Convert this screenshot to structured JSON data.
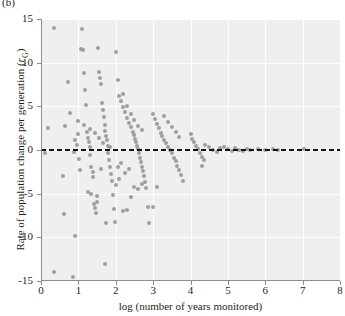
{
  "panel": {
    "tag": "(b)"
  },
  "chart_data": {
    "type": "scatter",
    "title": "",
    "xlabel": "log (number of years monitored)",
    "ylabel_plain": "Rate of population change per generation (rG)",
    "ylabel_main": "Rate of population change per generation (",
    "ylabel_italic": "r",
    "ylabel_sub": "G",
    "ylabel_close": ")",
    "xlim": [
      0,
      8
    ],
    "ylim": [
      -15,
      15
    ],
    "xticks": [
      0,
      1,
      2,
      3,
      4,
      5,
      6,
      7,
      8
    ],
    "yticks": [
      15,
      10,
      5,
      0,
      -5,
      -10,
      -15
    ],
    "grid": true,
    "grid_color": "#ffffff",
    "plot_background": "#efefef",
    "point_color": "#9a9a9a",
    "point_size_px": 4,
    "legend": "none",
    "annotations": [
      {
        "type": "hline",
        "y": 0,
        "style": "dashed",
        "color": "#111111"
      }
    ],
    "series_name": "populations",
    "n_points": 452,
    "points": [
      [
        0.12,
        -0.4
      ],
      [
        0.18,
        2.5
      ],
      [
        0.35,
        14.0
      ],
      [
        0.35,
        -14.0
      ],
      [
        0.6,
        -3.0
      ],
      [
        0.62,
        -7.3
      ],
      [
        0.65,
        2.8
      ],
      [
        0.72,
        7.8
      ],
      [
        0.78,
        4.2
      ],
      [
        0.85,
        -14.5
      ],
      [
        0.88,
        -0.2
      ],
      [
        0.9,
        -9.9
      ],
      [
        0.92,
        1.2
      ],
      [
        0.95,
        0.6
      ],
      [
        0.98,
        3.3
      ],
      [
        1.0,
        1.8
      ],
      [
        1.02,
        -1.0
      ],
      [
        1.05,
        -2.3
      ],
      [
        1.08,
        11.6
      ],
      [
        1.1,
        13.8
      ],
      [
        1.12,
        11.5
      ],
      [
        1.15,
        8.8
      ],
      [
        1.18,
        6.9
      ],
      [
        1.2,
        5.2
      ],
      [
        1.22,
        2.1
      ],
      [
        1.25,
        1.4
      ],
      [
        1.28,
        0.9
      ],
      [
        1.3,
        0.3
      ],
      [
        1.32,
        -0.6
      ],
      [
        1.35,
        -1.9
      ],
      [
        1.38,
        -2.5
      ],
      [
        1.4,
        -3.1
      ],
      [
        1.42,
        -6.2
      ],
      [
        1.45,
        -6.6
      ],
      [
        1.48,
        -7.2
      ],
      [
        1.5,
        -6.0
      ],
      [
        1.52,
        11.7
      ],
      [
        1.55,
        8.9
      ],
      [
        1.58,
        8.3
      ],
      [
        1.6,
        7.6
      ],
      [
        1.62,
        5.4
      ],
      [
        1.65,
        4.6
      ],
      [
        1.68,
        3.8
      ],
      [
        1.7,
        2.9
      ],
      [
        1.72,
        2.2
      ],
      [
        1.74,
        1.6
      ],
      [
        1.76,
        1.1
      ],
      [
        1.78,
        0.5
      ],
      [
        1.8,
        -0.3
      ],
      [
        1.82,
        -1.2
      ],
      [
        1.85,
        -2.0
      ],
      [
        1.88,
        -2.8
      ],
      [
        1.9,
        -3.6
      ],
      [
        1.92,
        -5.2
      ],
      [
        1.95,
        -6.8
      ],
      [
        1.98,
        -8.3
      ],
      [
        1.7,
        -13.0
      ],
      [
        2.0,
        11.2
      ],
      [
        2.05,
        8.0
      ],
      [
        2.1,
        6.2
      ],
      [
        2.15,
        5.6
      ],
      [
        2.2,
        4.9
      ],
      [
        2.25,
        4.3
      ],
      [
        2.3,
        3.7
      ],
      [
        2.35,
        3.1
      ],
      [
        2.4,
        2.6
      ],
      [
        2.45,
        2.1
      ],
      [
        2.5,
        1.7
      ],
      [
        2.52,
        1.3
      ],
      [
        2.55,
        0.9
      ],
      [
        2.58,
        0.5
      ],
      [
        2.6,
        0.1
      ],
      [
        2.62,
        -0.4
      ],
      [
        2.65,
        -0.9
      ],
      [
        2.68,
        -1.4
      ],
      [
        2.7,
        -1.9
      ],
      [
        2.72,
        -2.4
      ],
      [
        2.75,
        -3.0
      ],
      [
        2.78,
        -3.7
      ],
      [
        2.8,
        -4.4
      ],
      [
        2.85,
        -6.5
      ],
      [
        2.9,
        -8.4
      ],
      [
        2.0,
        -4.0
      ],
      [
        2.1,
        -3.3
      ],
      [
        2.2,
        -7.0
      ],
      [
        2.3,
        -6.9
      ],
      [
        2.4,
        -5.4
      ],
      [
        2.5,
        -4.2
      ],
      [
        2.6,
        -4.5
      ],
      [
        2.7,
        -3.9
      ],
      [
        2.2,
        6.4
      ],
      [
        2.3,
        5.0
      ],
      [
        2.4,
        4.1
      ],
      [
        2.5,
        3.4
      ],
      [
        2.6,
        2.8
      ],
      [
        2.7,
        2.3
      ],
      [
        3.0,
        4.1
      ],
      [
        3.05,
        3.5
      ],
      [
        3.1,
        3.0
      ],
      [
        3.15,
        2.5
      ],
      [
        3.2,
        2.0
      ],
      [
        3.25,
        1.6
      ],
      [
        3.3,
        1.2
      ],
      [
        3.35,
        0.8
      ],
      [
        3.4,
        0.4
      ],
      [
        3.45,
        0.0
      ],
      [
        3.5,
        -0.4
      ],
      [
        3.55,
        -0.9
      ],
      [
        3.6,
        -1.3
      ],
      [
        3.65,
        -1.8
      ],
      [
        3.7,
        -2.3
      ],
      [
        3.75,
        -2.9
      ],
      [
        3.8,
        -3.6
      ],
      [
        3.1,
        -4.2
      ],
      [
        3.0,
        -6.5
      ],
      [
        3.3,
        3.9
      ],
      [
        3.4,
        3.2
      ],
      [
        3.5,
        2.6
      ],
      [
        3.6,
        2.1
      ],
      [
        3.7,
        1.5
      ],
      [
        4.0,
        1.8
      ],
      [
        4.05,
        1.3
      ],
      [
        4.1,
        0.9
      ],
      [
        4.15,
        0.5
      ],
      [
        4.2,
        0.1
      ],
      [
        4.25,
        -0.3
      ],
      [
        4.3,
        -0.8
      ],
      [
        4.35,
        -1.2
      ],
      [
        4.3,
        -1.8
      ],
      [
        4.4,
        0.6
      ],
      [
        4.5,
        0.3
      ],
      [
        4.6,
        0.0
      ],
      [
        4.7,
        -0.2
      ],
      [
        4.8,
        0.2
      ],
      [
        4.9,
        0.4
      ],
      [
        5.0,
        0.1
      ],
      [
        5.1,
        -0.1
      ],
      [
        5.2,
        0.2
      ],
      [
        5.3,
        0.0
      ],
      [
        5.4,
        -0.1
      ],
      [
        5.5,
        0.1
      ],
      [
        5.6,
        0.0
      ],
      [
        5.8,
        0.1
      ],
      [
        6.0,
        0.0
      ],
      [
        6.2,
        0.1
      ],
      [
        6.35,
        0.0
      ],
      [
        7.05,
        0.1
      ],
      [
        1.25,
        -4.8
      ],
      [
        1.35,
        -5.0
      ],
      [
        1.5,
        -5.3
      ],
      [
        1.6,
        -2.2
      ],
      [
        1.75,
        -8.4
      ],
      [
        2.05,
        -2.0
      ],
      [
        2.15,
        -1.5
      ],
      [
        2.25,
        -2.6
      ],
      [
        2.35,
        -2.2
      ],
      [
        1.15,
        2.9
      ],
      [
        1.3,
        2.4
      ],
      [
        1.45,
        1.9
      ],
      [
        1.55,
        1.4
      ],
      [
        1.65,
        0.8
      ],
      [
        1.85,
        0.4
      ]
    ]
  }
}
